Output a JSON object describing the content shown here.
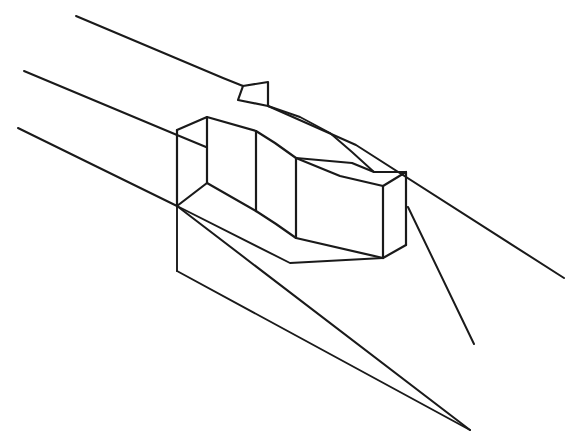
{
  "figure": {
    "medium": "black ink line drawing on white ground",
    "projection": "axonometric / isometric",
    "background_color": "#ffffff",
    "line_color": "#1a1a1a",
    "canvas": {
      "width": 585,
      "height": 444
    },
    "caption": ""
  },
  "chart_data": {
    "type": "line",
    "xlabel": "",
    "ylabel": "",
    "xlim": [
      0,
      585
    ],
    "ylim": [
      0,
      444
    ],
    "grid": false,
    "legend": "none",
    "series": [
      {
        "name": "road-edge-upper",
        "role": "ground line",
        "points": [
          [
            76,
            16
          ],
          [
            223,
            78
          ],
          [
            243,
            86
          ]
        ]
      },
      {
        "name": "road-edge-upper-continuation",
        "role": "ground line",
        "points": [
          [
            268,
            106
          ],
          [
            356,
            145
          ],
          [
            564,
            278
          ]
        ]
      },
      {
        "name": "road-edge-middle",
        "role": "ground line",
        "points": [
          [
            24,
            71
          ],
          [
            177,
            135
          ],
          [
            206,
            147
          ]
        ]
      },
      {
        "name": "road-edge-middle-continuation",
        "role": "ground line",
        "points": [
          [
            408,
            207
          ],
          [
            474,
            344
          ]
        ]
      },
      {
        "name": "road-edge-lower",
        "role": "ground line",
        "points": [
          [
            18,
            128
          ],
          [
            177,
            206
          ],
          [
            470,
            430
          ]
        ]
      },
      {
        "name": "notch-flag",
        "role": "triangular notch in kerb",
        "points": [
          [
            243,
            86
          ],
          [
            268,
            82
          ],
          [
            268,
            106
          ],
          [
            238,
            100
          ],
          [
            243,
            86
          ]
        ]
      },
      {
        "name": "mass-top-ridge",
        "role": "roof ridge / upper outline",
        "points": [
          [
            207,
            117
          ],
          [
            256,
            131
          ],
          [
            296,
            143
          ],
          [
            320,
            150
          ],
          [
            352,
            163
          ],
          [
            374,
            172
          ],
          [
            406,
            172
          ]
        ]
      },
      {
        "name": "mass-top-left-slope",
        "role": "roof plane left edge",
        "points": [
          [
            207,
            117
          ],
          [
            177,
            130
          ]
        ]
      },
      {
        "name": "mass-upper-back-profile",
        "role": "upper back silhouette",
        "points": [
          [
            268,
            106
          ],
          [
            300,
            117
          ],
          [
            330,
            133
          ],
          [
            352,
            152
          ],
          [
            374,
            172
          ]
        ]
      },
      {
        "name": "mass-front-vertical-left",
        "role": "vertical corner edge",
        "points": [
          [
            207,
            117
          ],
          [
            207,
            183
          ]
        ]
      },
      {
        "name": "mass-back-vertical-left",
        "role": "vertical corner edge",
        "points": [
          [
            177,
            130
          ],
          [
            177,
            206
          ]
        ]
      },
      {
        "name": "mass-interior-vertical-1",
        "role": "vertical facade division",
        "points": [
          [
            256,
            131
          ],
          [
            256,
            211
          ]
        ]
      },
      {
        "name": "mass-interior-vertical-2",
        "role": "vertical facade division",
        "points": [
          [
            296,
            158
          ],
          [
            296,
            238
          ]
        ]
      },
      {
        "name": "mass-front-vertical-right",
        "role": "vertical corner edge",
        "points": [
          [
            383,
            186
          ],
          [
            383,
            258
          ]
        ]
      },
      {
        "name": "mass-outer-vertical-right",
        "role": "vertical corner edge",
        "points": [
          [
            406,
            172
          ],
          [
            406,
            245
          ]
        ]
      },
      {
        "name": "mass-mid-step-edge",
        "role": "stepped facade profile",
        "points": [
          [
            256,
            131
          ],
          [
            275,
            143
          ],
          [
            296,
            158
          ],
          [
            352,
            163
          ]
        ]
      },
      {
        "name": "mass-right-roof-edge",
        "role": "roof plane right edge",
        "points": [
          [
            296,
            158
          ],
          [
            352,
            163
          ],
          [
            374,
            172
          ],
          [
            383,
            186
          ]
        ]
      },
      {
        "name": "mass-right-roof-edge-b",
        "role": "roof plane right edge",
        "points": [
          [
            383,
            186
          ],
          [
            406,
            172
          ]
        ]
      },
      {
        "name": "mass-base-left",
        "role": "base / ground contact line",
        "points": [
          [
            177,
            206
          ],
          [
            207,
            183
          ],
          [
            256,
            211
          ]
        ]
      },
      {
        "name": "mass-base-step",
        "role": "base / ground contact line",
        "points": [
          [
            256,
            211
          ],
          [
            276,
            224
          ],
          [
            296,
            238
          ],
          [
            383,
            258
          ]
        ]
      },
      {
        "name": "mass-base-right",
        "role": "base / ground contact line",
        "points": [
          [
            383,
            258
          ],
          [
            406,
            245
          ]
        ]
      },
      {
        "name": "mass-base-long-lower",
        "role": "base / ground contact line",
        "points": [
          [
            177,
            206
          ],
          [
            290,
            263
          ],
          [
            383,
            258
          ]
        ]
      },
      {
        "name": "drop-vertical-left",
        "role": "extended ground projection",
        "points": [
          [
            177,
            206
          ],
          [
            177,
            271
          ]
        ]
      },
      {
        "name": "drop-diagonal",
        "role": "extended ground projection",
        "points": [
          [
            177,
            271
          ],
          [
            470,
            430
          ]
        ]
      }
    ]
  },
  "labels": {
    "none_visible": ""
  }
}
